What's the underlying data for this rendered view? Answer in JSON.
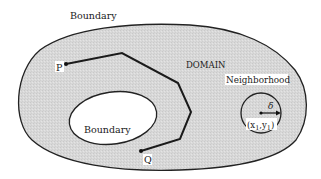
{
  "diagram": {
    "outer_boundary_label": "Boundary",
    "domain_label": "DOMAIN",
    "neighborhood_label": "Neighborhood",
    "inner_boundary_label": "Boundary",
    "point_p_label": "P",
    "point_q_label": "Q",
    "radius_label": "δ",
    "center_label_x": "(x",
    "center_label_sub1": "1",
    "center_label_sep": ",y",
    "center_label_sub2": "1",
    "center_label_close": ")"
  },
  "colors": {
    "domain_fill": "#d9d9d9",
    "stroke": "#222222",
    "hole_fill": "#ffffff"
  }
}
